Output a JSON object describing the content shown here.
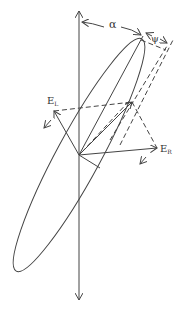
{
  "diagram": {
    "type": "polarization-ellipse",
    "labels": {
      "alpha": "α",
      "psi": "ψ",
      "e_left_main": "E",
      "e_left_sub": "L",
      "e_right_main": "E",
      "e_right_sub": "R"
    },
    "colors": {
      "stroke": "#444444",
      "background": "#ffffff"
    }
  }
}
